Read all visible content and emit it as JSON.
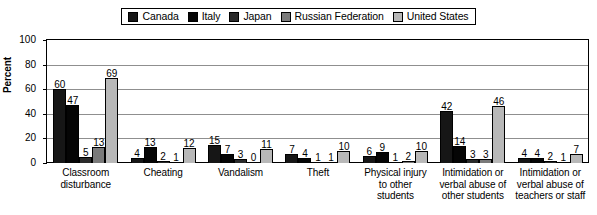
{
  "chart_data": {
    "type": "bar",
    "title": "",
    "xlabel": "",
    "ylabel": "Percent",
    "ylim": [
      0,
      100
    ],
    "yticks": [
      0,
      20,
      40,
      60,
      80,
      100
    ],
    "grid": true,
    "legend_position": "top-center",
    "categories": [
      "Classroom disturbance",
      "Cheating",
      "Vandalism",
      "Theft",
      "Physical injury to other students",
      "Intimidation or verbal abuse of other students",
      "Intimidation or verbal abuse of teachers or staff"
    ],
    "category_lines": [
      [
        "Classroom",
        "disturbance"
      ],
      [
        "Cheating"
      ],
      [
        "Vandalism"
      ],
      [
        "Theft"
      ],
      [
        "Physical injury",
        "to other",
        "students"
      ],
      [
        "Intimidation or",
        "verbal abuse of",
        "other students"
      ],
      [
        "Intimidation or",
        "verbal abuse of",
        "teachers or staff"
      ]
    ],
    "series": [
      {
        "name": "Canada",
        "color": "#161616",
        "values": [
          60,
          4,
          15,
          7,
          6,
          42,
          4
        ]
      },
      {
        "name": "Italy",
        "color": "#050505",
        "values": [
          47,
          13,
          7,
          4,
          9,
          14,
          4
        ]
      },
      {
        "name": "Japan",
        "color": "#2a2a2a",
        "values": [
          5,
          2,
          3,
          1,
          1,
          3,
          2
        ]
      },
      {
        "name": "Russian Federation",
        "color": "#7a7a7a",
        "values": [
          13,
          1,
          0,
          1,
          2,
          3,
          1
        ]
      },
      {
        "name": "United States",
        "color": "#b8b8b8",
        "values": [
          69,
          12,
          11,
          10,
          10,
          46,
          7
        ]
      }
    ]
  }
}
